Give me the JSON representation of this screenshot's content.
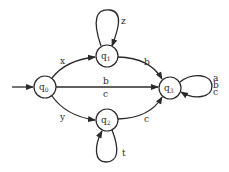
{
  "diagram": {
    "type": "finite-state-automaton",
    "initial_state": "q0",
    "states": [
      {
        "id": "q0",
        "base": "q",
        "sub": "0",
        "cx": 45,
        "cy": 87
      },
      {
        "id": "q1",
        "base": "q",
        "sub": "1",
        "cx": 107,
        "cy": 56
      },
      {
        "id": "q2",
        "base": "q",
        "sub": "2",
        "cx": 107,
        "cy": 120
      },
      {
        "id": "q3",
        "base": "q",
        "sub": "3",
        "cx": 170,
        "cy": 88
      }
    ],
    "transitions": [
      {
        "from": "q0",
        "to": "q1",
        "label": "x"
      },
      {
        "from": "q0",
        "to": "q2",
        "label": "y"
      },
      {
        "from": "q0",
        "to": "q3",
        "label_top": "b",
        "label_bottom": "c"
      },
      {
        "from": "q1",
        "to": "q1",
        "label": "z"
      },
      {
        "from": "q1",
        "to": "q3",
        "label": "b"
      },
      {
        "from": "q2",
        "to": "q2",
        "label": "t"
      },
      {
        "from": "q2",
        "to": "q3",
        "label": "c"
      },
      {
        "from": "q3",
        "to": "q3",
        "labels": [
          "a",
          "b",
          "c"
        ]
      }
    ]
  },
  "colors": {
    "stroke": "#2a2a2a",
    "background": "#ffffff"
  }
}
